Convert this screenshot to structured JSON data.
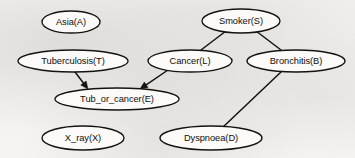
{
  "diagram": {
    "type": "directed-acyclic-graph",
    "background_color": "#f4f3f1",
    "stroke_color": "#15130f",
    "node_fill_color": "#fbfaf8",
    "nodes": [
      {
        "id": "A",
        "label": "Asia(A)",
        "cx": 71,
        "cy": 22,
        "rx": 29,
        "ry": 11
      },
      {
        "id": "S",
        "label": "Smoker(S)",
        "cx": 241,
        "cy": 21,
        "rx": 39,
        "ry": 12
      },
      {
        "id": "T",
        "label": "Tuberculosis(T)",
        "cx": 73,
        "cy": 61,
        "rx": 55,
        "ry": 11
      },
      {
        "id": "L",
        "label": "Cancer(L)",
        "cx": 190,
        "cy": 61,
        "rx": 42,
        "ry": 11
      },
      {
        "id": "B",
        "label": "Bronchitis(B)",
        "cx": 296,
        "cy": 61,
        "rx": 49,
        "ry": 11
      },
      {
        "id": "E",
        "label": "Tub_or_cancer(E)",
        "cx": 117,
        "cy": 99,
        "rx": 62,
        "ry": 11
      },
      {
        "id": "X",
        "label": "X_ray(X)",
        "cx": 83,
        "cy": 138,
        "rx": 41,
        "ry": 12
      },
      {
        "id": "D",
        "label": "Dyspnoea(D)",
        "cx": 211,
        "cy": 138,
        "rx": 51,
        "ry": 12
      }
    ],
    "edges": [
      {
        "from": "S",
        "to": "L",
        "x1": 226,
        "y1": 31,
        "x2": 201,
        "y2": 50,
        "arrowhead": false
      },
      {
        "from": "S",
        "to": "B",
        "x1": 256,
        "y1": 31,
        "x2": 281,
        "y2": 50,
        "arrowhead": false
      },
      {
        "from": "T",
        "to": "E",
        "x1": 75,
        "y1": 72,
        "x2": 88,
        "y2": 89,
        "arrowhead": true
      },
      {
        "from": "L",
        "to": "E",
        "x1": 168,
        "y1": 70,
        "x2": 140,
        "y2": 89,
        "arrowhead": true
      },
      {
        "from": "B",
        "to": "D",
        "x1": 281,
        "y1": 72,
        "x2": 222,
        "y2": 128,
        "arrowhead": false
      }
    ]
  }
}
